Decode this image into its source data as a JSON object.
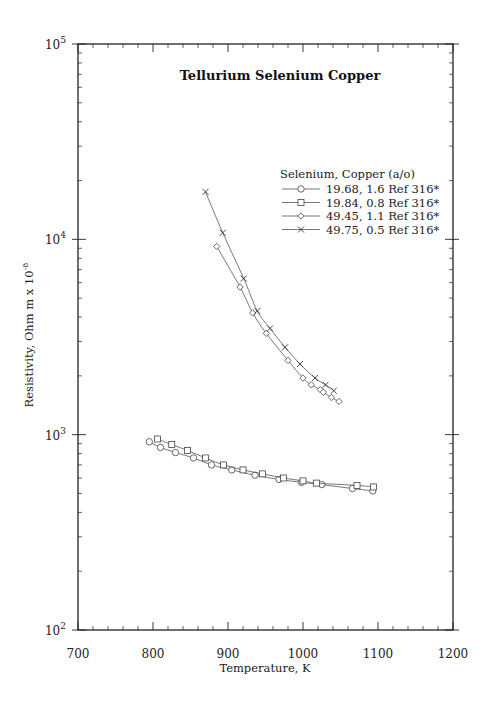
{
  "chart_data": {
    "type": "line",
    "title": "Tellurium Selenium Copper",
    "xlabel": "Temperature,  K",
    "ylabel": "Resistivity, Ohm m x 10",
    "ylabel_exponent": "-8",
    "xlim": [
      700,
      1200
    ],
    "ylim": [
      100,
      100000
    ],
    "yscale": "log",
    "x_ticks": [
      700,
      800,
      900,
      1000,
      1100,
      1200
    ],
    "x_tick_labels": [
      "700",
      "800",
      "900",
      "1000",
      "1100",
      "1200"
    ],
    "y_ticks": [
      100,
      1000,
      10000,
      100000
    ],
    "y_tick_labels": [
      {
        "base": "10",
        "exp": "2"
      },
      {
        "base": "10",
        "exp": "3"
      },
      {
        "base": "10",
        "exp": "4"
      },
      {
        "base": "10",
        "exp": "5"
      }
    ],
    "grid": false,
    "legend_title": "Selenium, Copper (a/o)",
    "legend_position": "upper right (inside)",
    "series": [
      {
        "name": "19.68, 1.6 Ref 316*",
        "marker": "circle",
        "x": [
          795,
          810,
          830,
          854,
          878,
          905,
          936,
          968,
          998,
          1025,
          1066,
          1093
        ],
        "y": [
          920,
          860,
          810,
          760,
          700,
          660,
          620,
          590,
          570,
          555,
          530,
          515
        ]
      },
      {
        "name": "19.84, 0.8 Ref 316*",
        "marker": "square",
        "x": [
          806,
          825,
          846,
          870,
          894,
          920,
          946,
          974,
          1000,
          1018,
          1072,
          1094
        ],
        "y": [
          950,
          890,
          830,
          760,
          700,
          660,
          630,
          600,
          580,
          565,
          550,
          540
        ]
      },
      {
        "name": "49.45, 1.1 Ref 316*",
        "marker": "diamond",
        "x": [
          885,
          916,
          933,
          951,
          980,
          1000,
          1011,
          1023,
          1027,
          1038,
          1048
        ],
        "y": [
          9200,
          5700,
          4200,
          3300,
          2400,
          1950,
          1800,
          1700,
          1650,
          1550,
          1480
        ]
      },
      {
        "name": "49.75, 0.5 Ref 316*",
        "marker": "x",
        "x": [
          870,
          893,
          921,
          939,
          956,
          976,
          996,
          1016,
          1030,
          1041
        ],
        "y": [
          17500,
          10800,
          6300,
          4300,
          3500,
          2800,
          2300,
          1950,
          1800,
          1680
        ]
      }
    ]
  }
}
